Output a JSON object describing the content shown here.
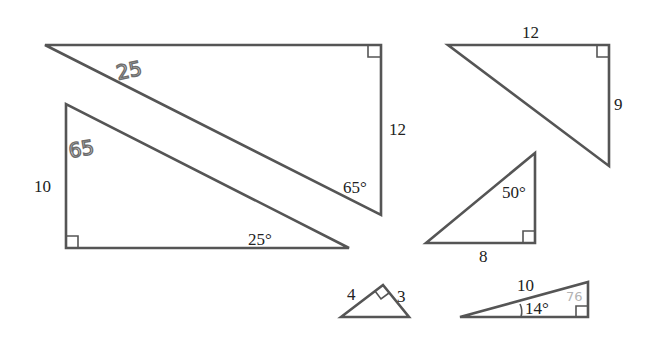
{
  "diagram": {
    "title": "",
    "stroke_color": "#555555",
    "label_color": "#222222",
    "handwriting_color": "#6d6d6d",
    "triangles": [
      {
        "id": "t1",
        "labels": {
          "side_right": "12",
          "angle_bottom": "65°"
        },
        "handwritten": "25",
        "right_angle": "top-right"
      },
      {
        "id": "t2",
        "labels": {
          "side_left": "10",
          "angle_right": "25°"
        },
        "handwritten": "65",
        "right_angle": "bottom-left"
      },
      {
        "id": "t3",
        "labels": {
          "side_top": "12",
          "side_right": "9"
        },
        "right_angle": "top-right"
      },
      {
        "id": "t4",
        "labels": {
          "angle_top": "50°",
          "side_bottom": "8"
        },
        "right_angle": "bottom-right"
      },
      {
        "id": "t5",
        "labels": {
          "side_left": "4",
          "side_right": "3"
        },
        "right_angle": "apex"
      },
      {
        "id": "t6",
        "labels": {
          "hypotenuse": "10",
          "angle_left": "14°"
        },
        "handwritten": "76",
        "right_angle": "bottom-right"
      }
    ]
  }
}
